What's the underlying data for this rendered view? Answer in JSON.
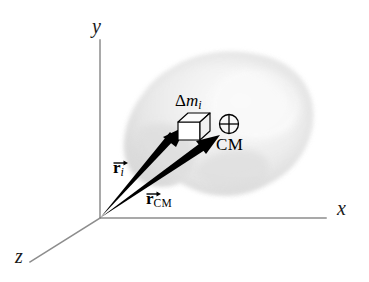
{
  "figure": {
    "background_color": "#ffffff",
    "width": 369,
    "height": 282
  },
  "axes": {
    "x_label": "x",
    "y_label": "y",
    "z_label": "z",
    "line_color": "#8d8d8d",
    "origin": {
      "x": 100,
      "y": 218
    }
  },
  "body": {
    "name": "rigid-body-blob",
    "fill_color": "#e2e2e2",
    "highlight_color": "#f6f6f6",
    "edge_color": "#d5d5d5"
  },
  "mass_element": {
    "label_delta": "Δ",
    "label_m": "m",
    "label_i": "i",
    "shape": "cube",
    "edge_color": "#000000",
    "face_color": "#ffffff"
  },
  "center_of_mass": {
    "label": "CM",
    "symbol": "circled-cross",
    "color": "#000000"
  },
  "vectors": [
    {
      "name": "r-i",
      "stem": "r",
      "subscript": "i",
      "subscript_italic": true,
      "color": "#000000",
      "from": "origin",
      "to": "mass-element"
    },
    {
      "name": "r-cm",
      "stem": "r",
      "subscript": "CM",
      "subscript_italic": false,
      "color": "#000000",
      "from": "origin",
      "to": "center-of-mass"
    }
  ]
}
